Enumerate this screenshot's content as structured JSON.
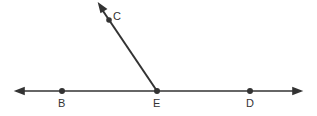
{
  "diagram": {
    "type": "geometry-rays",
    "line": {
      "label": "line BD",
      "points": [
        "B",
        "E",
        "D"
      ]
    },
    "ray": {
      "label": "ray EC",
      "from": "E",
      "through": "C"
    },
    "points": [
      {
        "id": "B",
        "label": "B"
      },
      {
        "id": "E",
        "label": "E"
      },
      {
        "id": "D",
        "label": "D"
      },
      {
        "id": "C",
        "label": "C"
      }
    ],
    "stroke_color": "#333333"
  }
}
